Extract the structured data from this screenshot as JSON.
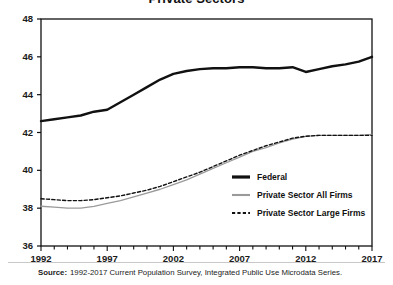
{
  "chart_data": {
    "type": "line",
    "title": "Private Sectors",
    "xlabel": "",
    "ylabel": "",
    "xlim": [
      1992,
      2017
    ],
    "ylim": [
      36,
      48
    ],
    "ytick_labels": [
      "36",
      "38",
      "40",
      "42",
      "44",
      "46",
      "48"
    ],
    "yticks": [
      36,
      38,
      40,
      42,
      44,
      46,
      48
    ],
    "xtick_labels": [
      "1992",
      "1997",
      "2002",
      "2007",
      "2012",
      "2017"
    ],
    "xticks": [
      1992,
      1997,
      2002,
      2007,
      2012,
      2017
    ],
    "minor_xtick_interval": 1,
    "grid": false,
    "legend_position": "center-right-inside",
    "x": [
      1992,
      1993,
      1994,
      1995,
      1996,
      1997,
      1998,
      1999,
      2000,
      2001,
      2002,
      2003,
      2004,
      2005,
      2006,
      2007,
      2008,
      2009,
      2010,
      2011,
      2012,
      2013,
      2014,
      2015,
      2016,
      2017
    ],
    "series": [
      {
        "name": "Federal",
        "style": "solid",
        "color": "#111111",
        "width": 2.4,
        "values": [
          42.6,
          42.7,
          42.8,
          42.9,
          43.1,
          43.2,
          43.6,
          44.0,
          44.4,
          44.8,
          45.1,
          45.25,
          45.35,
          45.4,
          45.4,
          45.45,
          45.45,
          45.4,
          45.4,
          45.45,
          45.2,
          45.35,
          45.5,
          45.6,
          45.75,
          46.0
        ]
      },
      {
        "name": "Private Sector All Firms",
        "style": "solid",
        "color": "#9a9a9a",
        "width": 1.3,
        "values": [
          38.1,
          38.05,
          38.0,
          38.0,
          38.1,
          38.25,
          38.4,
          38.6,
          38.8,
          39.0,
          39.25,
          39.5,
          39.8,
          40.1,
          40.4,
          40.7,
          41.0,
          41.2,
          41.45,
          41.65,
          41.8,
          41.85,
          41.85,
          41.85,
          41.85,
          41.9
        ]
      },
      {
        "name": "Private Sector Large Firms",
        "style": "dashed",
        "color": "#111111",
        "width": 1.4,
        "values": [
          38.5,
          38.45,
          38.4,
          38.4,
          38.45,
          38.55,
          38.65,
          38.8,
          38.95,
          39.15,
          39.4,
          39.65,
          39.9,
          40.2,
          40.5,
          40.8,
          41.05,
          41.3,
          41.5,
          41.7,
          41.8,
          41.85,
          41.85,
          41.85,
          41.85,
          41.85
        ]
      }
    ]
  },
  "source": {
    "label": "Source:",
    "text": "1992-2017 Current Population Survey, Integrated Public Use Microdata Series."
  }
}
